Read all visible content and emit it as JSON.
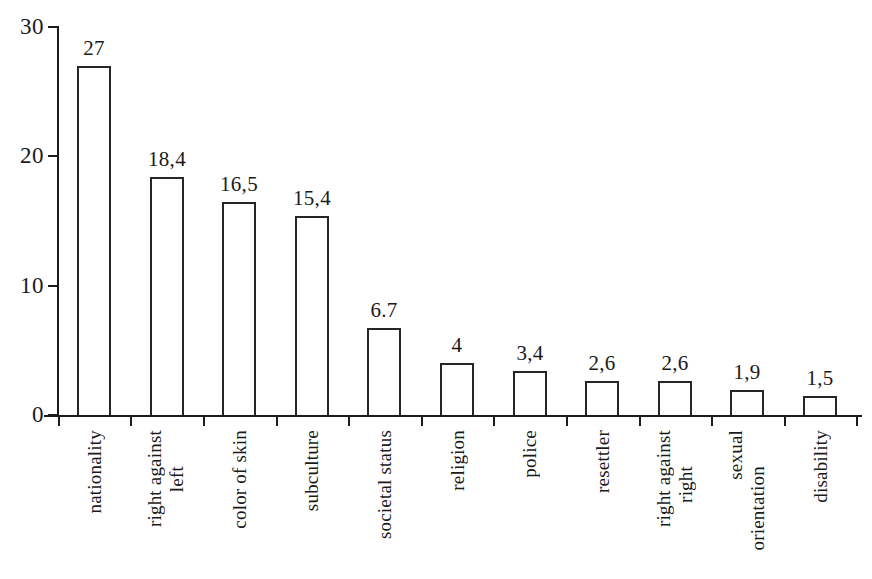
{
  "chart_data": {
    "type": "bar",
    "title": "",
    "subtitle": "",
    "xlabel": "",
    "ylabel": "",
    "ylim": [
      0,
      30
    ],
    "ytick_values": [
      0,
      10,
      20,
      30
    ],
    "ytick_labels": [
      "0",
      "10",
      "20",
      "30"
    ],
    "grid": false,
    "legend": null,
    "categories": [
      "nationality",
      "right against left",
      "color of skin",
      "subculture",
      "societal status",
      "religion",
      "police",
      "resettler",
      "right against right",
      "sexual orientation",
      "disability"
    ],
    "values": [
      27,
      18.4,
      16.5,
      15.4,
      6.7,
      4,
      3.4,
      2.6,
      2.6,
      1.9,
      1.5
    ],
    "value_labels": [
      "27",
      "18,4",
      "16,5",
      "15,4",
      "6.7",
      "4",
      "3,4",
      "2,6",
      "2,6",
      "1,9",
      "1,5"
    ],
    "bars": [
      {
        "category_lines": [
          "nationality"
        ],
        "value": 27,
        "label": "27"
      },
      {
        "category_lines": [
          "right against",
          "left"
        ],
        "value": 18.4,
        "label": "18,4"
      },
      {
        "category_lines": [
          "color of skin"
        ],
        "value": 16.5,
        "label": "16,5"
      },
      {
        "category_lines": [
          "subculture"
        ],
        "value": 15.4,
        "label": "15,4"
      },
      {
        "category_lines": [
          "societal status"
        ],
        "value": 6.7,
        "label": "6.7"
      },
      {
        "category_lines": [
          "religion"
        ],
        "value": 4,
        "label": "4"
      },
      {
        "category_lines": [
          "police"
        ],
        "value": 3.4,
        "label": "3,4"
      },
      {
        "category_lines": [
          "resettler"
        ],
        "value": 2.6,
        "label": "2,6"
      },
      {
        "category_lines": [
          "right against",
          "right"
        ],
        "value": 2.6,
        "label": "2,6"
      },
      {
        "category_lines": [
          "sexual",
          "orientation"
        ],
        "value": 1.9,
        "label": "1,9"
      },
      {
        "category_lines": [
          "disability"
        ],
        "value": 1.5,
        "label": "1,5"
      }
    ],
    "colors": {
      "bar_fill": "#ffffff",
      "bar_stroke": "#262626",
      "axis": "#1c1c1c",
      "text": "#1a1a1a",
      "background": "#ffffff"
    }
  }
}
